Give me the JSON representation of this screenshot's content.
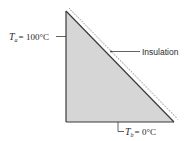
{
  "diagram": {
    "shape": "right-triangle",
    "fill_color": "#d6d6d6",
    "edge_color": "#3a3a3a",
    "labels": {
      "left_edge": {
        "symbol": "T",
        "subscript": "a",
        "equals": "= 100°C"
      },
      "bottom_edge": {
        "symbol": "T",
        "subscript": "b",
        "equals": "= 0°C"
      },
      "hypotenuse": {
        "text": "Insulation"
      }
    }
  }
}
